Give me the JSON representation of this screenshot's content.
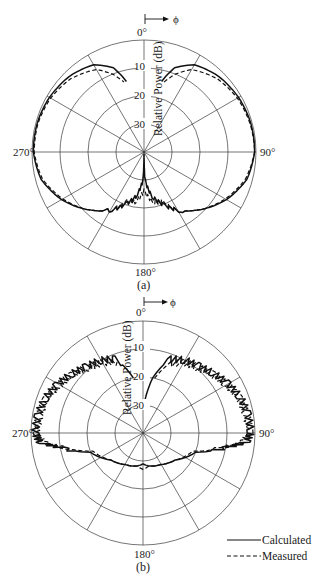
{
  "chart_data": [
    {
      "type": "polar",
      "caption": "(a)",
      "center": [
        144,
        152
      ],
      "outer_radius": 112,
      "phi_arrow_label": "ϕ",
      "angle_labels": {
        "top": "0°",
        "right": "90°",
        "bottom": "180°",
        "left": "270°"
      },
      "radial_axis_label": "Relative Power (dB)",
      "radial_ticks": [
        "10",
        "20",
        "30"
      ],
      "radial_range_db": [
        -40,
        0
      ],
      "spokes_deg": [
        0,
        30,
        60,
        90,
        120,
        150,
        180,
        210,
        240,
        270,
        300,
        330
      ],
      "series": [
        {
          "name": "Calculated",
          "style": "solid",
          "points_deg_db": [
            [
              14,
              -14
            ],
            [
              20,
              -8
            ],
            [
              30,
              -4
            ],
            [
              45,
              -2
            ],
            [
              60,
              -1
            ],
            [
              75,
              -0.5
            ],
            [
              90,
              -0.5
            ],
            [
              105,
              -2
            ],
            [
              120,
              -6
            ],
            [
              135,
              -11
            ],
            [
              150,
              -16
            ],
            [
              160,
              -20
            ],
            [
              170,
              -24
            ],
            [
              178,
              -30
            ],
            [
              180,
              -40
            ],
            [
              182,
              -30
            ],
            [
              190,
              -24
            ],
            [
              200,
              -20
            ],
            [
              210,
              -16
            ],
            [
              225,
              -11
            ],
            [
              240,
              -6
            ],
            [
              255,
              -2
            ],
            [
              270,
              -0.5
            ],
            [
              285,
              -0.5
            ],
            [
              300,
              -1
            ],
            [
              315,
              -2
            ],
            [
              330,
              -4
            ],
            [
              340,
              -8
            ],
            [
              346,
              -14
            ]
          ]
        },
        {
          "name": "Measured",
          "style": "dashed",
          "points_deg_db": [
            [
              16,
              -14
            ],
            [
              22,
              -10
            ],
            [
              30,
              -6
            ],
            [
              45,
              -3
            ],
            [
              60,
              -1.5
            ],
            [
              75,
              -0.8
            ],
            [
              90,
              -0.5
            ],
            [
              105,
              -2.5
            ],
            [
              120,
              -6.5
            ],
            [
              135,
              -11
            ],
            [
              150,
              -16
            ],
            [
              160,
              -21
            ],
            [
              170,
              -22
            ],
            [
              180,
              -26
            ],
            [
              190,
              -22
            ],
            [
              200,
              -21
            ],
            [
              210,
              -16
            ],
            [
              225,
              -11
            ],
            [
              240,
              -6.5
            ],
            [
              255,
              -2.5
            ],
            [
              270,
              -0.8
            ],
            [
              285,
              -0.8
            ],
            [
              300,
              -1.5
            ],
            [
              315,
              -3
            ],
            [
              330,
              -6
            ],
            [
              338,
              -10
            ],
            [
              344,
              -14
            ]
          ]
        }
      ]
    },
    {
      "type": "polar",
      "caption": "(b)",
      "center": [
        143,
        433
      ],
      "outer_radius": 112,
      "phi_arrow_label": "ϕ",
      "angle_labels": {
        "top": "0°",
        "right": "90°",
        "bottom": "180°",
        "left": "270°"
      },
      "radial_axis_label": "Relative Power (dB)",
      "radial_ticks": [
        "10",
        "20",
        "30"
      ],
      "radial_range_db": [
        -40,
        0
      ],
      "spokes_deg": [
        0,
        30,
        60,
        90,
        120,
        150,
        180,
        210,
        240,
        270,
        300,
        330
      ],
      "series": [
        {
          "name": "Calculated",
          "style": "solid",
          "points_deg_db": [
            [
              2,
              -30
            ],
            [
              10,
              -20
            ],
            [
              20,
              -12
            ],
            [
              30,
              -10
            ],
            [
              40,
              -9
            ],
            [
              50,
              -7
            ],
            [
              60,
              -5
            ],
            [
              70,
              -3
            ],
            [
              80,
              -2
            ],
            [
              90,
              -1.5
            ],
            [
              95,
              -3
            ],
            [
              100,
              -10
            ],
            [
              110,
              -20
            ],
            [
              130,
              -25
            ],
            [
              150,
              -27
            ],
            [
              170,
              -28
            ],
            [
              180,
              -29
            ],
            [
              190,
              -28
            ],
            [
              210,
              -27
            ],
            [
              230,
              -25
            ],
            [
              250,
              -20
            ],
            [
              260,
              -10
            ],
            [
              265,
              -3
            ],
            [
              270,
              -1.5
            ],
            [
              280,
              -2
            ],
            [
              290,
              -3
            ],
            [
              300,
              -5
            ],
            [
              310,
              -7
            ],
            [
              320,
              -9
            ],
            [
              330,
              -10
            ],
            [
              340,
              -12
            ],
            [
              350,
              -20
            ]
          ]
        },
        {
          "name": "Measured",
          "style": "dashed",
          "points_deg_db": [
            [
              12,
              -20
            ],
            [
              20,
              -14
            ],
            [
              30,
              -11
            ],
            [
              40,
              -9.5
            ],
            [
              50,
              -7.5
            ],
            [
              60,
              -5.5
            ],
            [
              70,
              -3.5
            ],
            [
              80,
              -2.5
            ],
            [
              90,
              -2
            ],
            [
              95,
              -4
            ],
            [
              100,
              -11
            ],
            [
              110,
              -21
            ],
            [
              130,
              -25
            ],
            [
              150,
              -27
            ],
            [
              170,
              -28
            ],
            [
              180,
              -27
            ],
            [
              190,
              -28
            ],
            [
              210,
              -27
            ],
            [
              230,
              -25
            ],
            [
              250,
              -21
            ],
            [
              260,
              -11
            ],
            [
              265,
              -4
            ],
            [
              270,
              -2
            ],
            [
              280,
              -2.5
            ],
            [
              290,
              -3.5
            ],
            [
              300,
              -5.5
            ],
            [
              310,
              -7.5
            ],
            [
              320,
              -9.5
            ],
            [
              330,
              -11
            ],
            [
              340,
              -13
            ]
          ]
        }
      ]
    }
  ],
  "legend": {
    "items": [
      {
        "label": "Calculated",
        "style": "solid"
      },
      {
        "label": "Measured",
        "style": "dashed"
      }
    ]
  },
  "plots": [
    {
      "caption": "(a)",
      "top": "0°",
      "right": "90°",
      "bottom": "180°",
      "left": "270°",
      "phi": "ϕ",
      "axis": "Relative Power (dB)",
      "t10": "10",
      "t20": "20",
      "t30": "30"
    },
    {
      "caption": "(b)",
      "top": "0°",
      "right": "90°",
      "bottom": "180°",
      "left": "270°",
      "phi": "ϕ",
      "axis": "Relative Power (dB)",
      "t10": "10",
      "t20": "20",
      "t30": "30"
    }
  ]
}
